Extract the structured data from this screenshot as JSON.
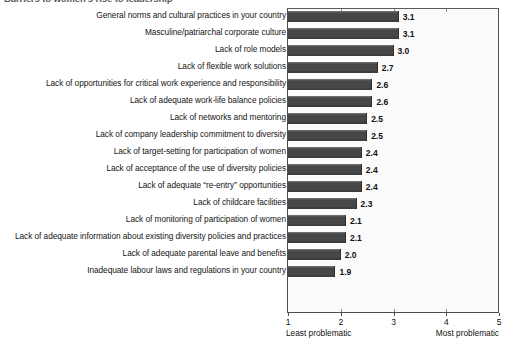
{
  "chart_data": {
    "type": "bar",
    "orientation": "horizontal",
    "title": "Barriers to women's rise to leadership",
    "xlabel": "",
    "ylabel": "",
    "xlim": [
      1,
      5
    ],
    "xticks": [
      1,
      2,
      3,
      4,
      5
    ],
    "xtick_labels": [
      "1",
      "2",
      "3",
      "4",
      "5"
    ],
    "axis_caption_low": "Least problematic",
    "axis_caption_high": "Most problematic",
    "grid": false,
    "legend": false,
    "bar_color": "#4a4a4a",
    "categories": [
      "General norms and cultural practices in your country",
      "Masculine/patriarchal corporate culture",
      "Lack of role models",
      "Lack of flexible work solutions",
      "Lack of opportunities for critical work experience and responsibility",
      "Lack of adequate work-life balance policies",
      "Lack of networks and mentoring",
      "Lack of company leadership commitment to diversity",
      "Lack of target-setting for participation of women",
      "Lack of acceptance of the use of diversity policies",
      "Lack of adequate “re-entry” opportunities",
      "Lack of childcare facilities",
      "Lack of monitoring of participation of women",
      "Lack of adequate information about existing diversity policies and practices",
      "Lack of adequate parental leave and benefits",
      "Inadequate labour laws and regulations in your country"
    ],
    "values": [
      3.1,
      3.1,
      3.0,
      2.7,
      2.6,
      2.6,
      2.5,
      2.5,
      2.4,
      2.4,
      2.4,
      2.3,
      2.1,
      2.1,
      2.0,
      1.9
    ],
    "value_labels": [
      "3.1",
      "3.1",
      "3.0",
      "2.7",
      "2.6",
      "2.6",
      "2.5",
      "2.5",
      "2.4",
      "2.4",
      "2.4",
      "2.3",
      "2.1",
      "2.1",
      "2.0",
      "1.9"
    ]
  }
}
